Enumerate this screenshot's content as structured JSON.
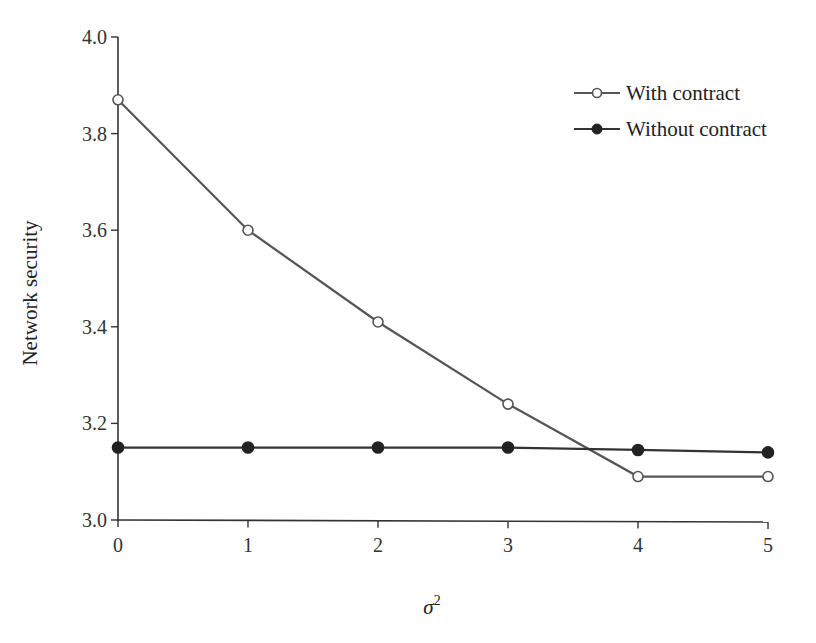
{
  "chart_data": {
    "type": "line",
    "title": "",
    "xlabel": "σ²",
    "ylabel": "Network security",
    "x": [
      0,
      1,
      2,
      3,
      4,
      5
    ],
    "xlim": [
      0,
      5
    ],
    "ylim": [
      3.0,
      4.0
    ],
    "x_ticks": [
      "0",
      "1",
      "2",
      "3",
      "4",
      "5"
    ],
    "y_ticks": [
      "3.0",
      "3.2",
      "3.4",
      "3.6",
      "3.8",
      "4.0"
    ],
    "grid": false,
    "legend_position": "upper right",
    "series": [
      {
        "name": "With contract",
        "marker": "open-circle",
        "color": "#555555",
        "values": [
          3.87,
          3.6,
          3.41,
          3.24,
          3.09,
          3.09
        ]
      },
      {
        "name": "Without contract",
        "marker": "filled-circle",
        "color": "#333333",
        "values": [
          3.15,
          3.15,
          3.15,
          3.15,
          3.145,
          3.14
        ]
      }
    ]
  },
  "legend": {
    "items": [
      {
        "label": "With contract"
      },
      {
        "label": "Without contract"
      }
    ]
  },
  "axes": {
    "xlabel_base": "σ",
    "xlabel_sup": "2",
    "ylabel": "Network security"
  }
}
